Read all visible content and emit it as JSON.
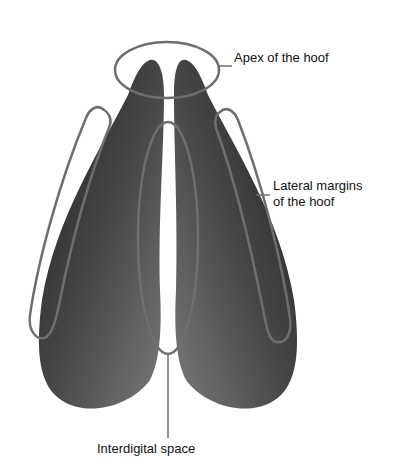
{
  "diagram": {
    "labels": {
      "apex": "Apex of the hoof",
      "lateral_line1": "Lateral margins",
      "lateral_line2": "of the hoof",
      "interdigital": "Interdigital space"
    },
    "colors": {
      "claw_dark": "#2a2a2a",
      "claw_light": "#8a8a8a",
      "outline": "#6e6e6e",
      "text": "#111111",
      "background": "#ffffff"
    }
  }
}
